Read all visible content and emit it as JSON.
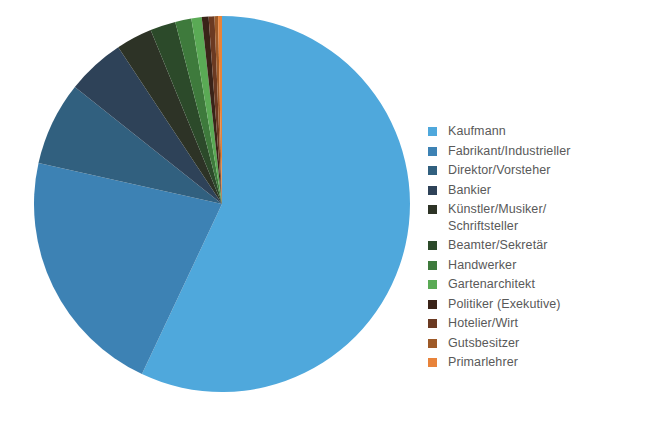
{
  "chart_data": {
    "type": "pie",
    "title": "",
    "subtitle": "",
    "xlabel": "",
    "ylabel": "",
    "legend_position": "right",
    "start_angle_deg": 0,
    "direction": "clockwise",
    "categories": [
      "Kaufmann",
      "Fabrikant/Industrieller",
      "Direktor/Vorsteher",
      "Bankier",
      "Künstler/Musiker/\nSchriftsteller",
      "Beamter/Sekretär",
      "Handwerker",
      "Gartenarchitekt",
      "Politiker (Exekutive)",
      "Hotelier/Wirt",
      "Gutsbesitzer",
      "Primarlehrer"
    ],
    "values": [
      57.0,
      21.5,
      7.2,
      5.0,
      3.1,
      2.2,
      1.4,
      0.9,
      0.6,
      0.5,
      0.3,
      0.3
    ],
    "colors": [
      "#4FA8DC",
      "#3D82B4",
      "#31607F",
      "#2E4258",
      "#2D3326",
      "#2C4A2A",
      "#3E7A3C",
      "#5AAA55",
      "#3A2318",
      "#6B3A22",
      "#9E5A28",
      "#E8833A"
    ],
    "slice_angles_deg": [
      {
        "label": "Kaufmann",
        "start": 0,
        "end": 205.2
      },
      {
        "label": "Fabrikant/Industrieller",
        "start": 205.2,
        "end": 282.6
      },
      {
        "label": "Direktor/Vorsteher",
        "start": 282.6,
        "end": 308.5
      },
      {
        "label": "Bankier",
        "start": 308.5,
        "end": 326.5
      },
      {
        "label": "Künstler/Musiker/Schriftsteller",
        "start": 326.5,
        "end": 337.7
      },
      {
        "label": "Beamter/Sekretär",
        "start": 337.7,
        "end": 345.6
      },
      {
        "label": "Handwerker",
        "start": 345.6,
        "end": 350.6
      },
      {
        "label": "Gartenarchitekt",
        "start": 350.6,
        "end": 353.8
      },
      {
        "label": "Politiker (Exekutive)",
        "start": 353.8,
        "end": 355.9
      },
      {
        "label": "Hotelier/Wirt",
        "start": 355.9,
        "end": 357.7
      },
      {
        "label": "Gutsbesitzer",
        "start": 357.7,
        "end": 358.8
      },
      {
        "label": "Primarlehrer",
        "start": 358.8,
        "end": 360.0
      }
    ],
    "geometry": {
      "cx": 222,
      "cy": 204,
      "r": 188
    }
  },
  "legend": {
    "items": [
      {
        "label": "Kaufmann",
        "color": "#4FA8DC"
      },
      {
        "label": "Fabrikant/Industrieller",
        "color": "#3D82B4"
      },
      {
        "label": "Direktor/Vorsteher",
        "color": "#31607F"
      },
      {
        "label": "Bankier",
        "color": "#2E4258"
      },
      {
        "label": "Künstler/Musiker/\nSchriftsteller",
        "color": "#2D3326"
      },
      {
        "label": "Beamter/Sekretär",
        "color": "#2C4A2A"
      },
      {
        "label": "Handwerker",
        "color": "#3E7A3C"
      },
      {
        "label": "Gartenarchitekt",
        "color": "#5AAA55"
      },
      {
        "label": "Politiker (Exekutive)",
        "color": "#3A2318"
      },
      {
        "label": "Hotelier/Wirt",
        "color": "#6B3A22"
      },
      {
        "label": "Gutsbesitzer",
        "color": "#9E5A28"
      },
      {
        "label": "Primarlehrer",
        "color": "#E8833A"
      }
    ]
  },
  "page": {
    "background": "#ffffff",
    "text_color": "#595959"
  }
}
